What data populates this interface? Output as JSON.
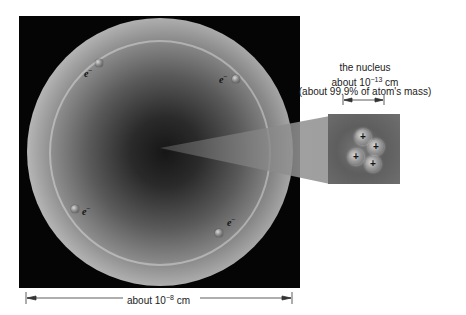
{
  "diagram": {
    "type": "atom-structure",
    "electron_symbol": "e",
    "electron_charge": "−",
    "electrons": [
      {
        "id": "top-left",
        "label": "e"
      },
      {
        "id": "top-right",
        "label": "e"
      },
      {
        "id": "bottom-left",
        "label": "e"
      },
      {
        "id": "bottom-right",
        "label": "e"
      }
    ],
    "nucleus": {
      "title": "the nucleus",
      "size_prefix": "about 10",
      "size_exponent": "−13",
      "size_unit": " cm",
      "mass_note": "(about 99.9% of atom's mass)",
      "proton_symbol": "+",
      "particle_count": 4
    },
    "atom_size": {
      "prefix": "about 10",
      "exponent": "−8",
      "unit": " cm"
    },
    "colors": {
      "background": "#ffffff",
      "atom_box": "#050505",
      "text": "#222222",
      "nucleus_box": "#6a6a6a"
    }
  }
}
